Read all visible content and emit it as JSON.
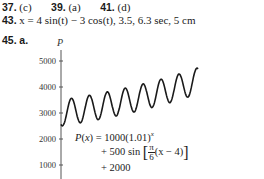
{
  "answers": {
    "line1": [
      {
        "num": "37.",
        "text": "(c)"
      },
      {
        "num": "39.",
        "text": "(a)"
      },
      {
        "num": "41.",
        "text": "(d)"
      }
    ],
    "line2": {
      "num": "43.",
      "text": "x = 4 sin(t) − 3 cos(t), 3.5, 6.3 sec, 5 cm"
    },
    "line3": {
      "num": "45.",
      "part": "a."
    }
  },
  "formula": {
    "line1": "P(x) = 1000(1.01)",
    "exp": "x",
    "line2_prefix": "+ 500 sin",
    "frac_num": "π",
    "frac_den": "6",
    "line2_suffix": "(x − 4)",
    "line3": "+ 2000"
  },
  "chart_data": {
    "type": "line",
    "title": "",
    "xlabel": "",
    "ylabel": "P",
    "yticks": [
      1000,
      2000,
      3000,
      4000,
      5000
    ],
    "ylim": [
      0,
      5500
    ],
    "xlim": [
      0,
      55
    ],
    "grid": false,
    "legend": null,
    "annotation": "P(x) = 1000(1.01)^x + 500 sin[π/6 (x − 4)] + 2000",
    "series": [
      {
        "name": "P(x)",
        "x": [
          0,
          3,
          6,
          9,
          12,
          15,
          18,
          21,
          24,
          27,
          30,
          33,
          36,
          39,
          42,
          45,
          48,
          51,
          54
        ],
        "values": [
          2567,
          3530,
          2561,
          3600,
          2630,
          3660,
          2710,
          3730,
          2780,
          3810,
          2860,
          3890,
          2940,
          3970,
          3020,
          4060,
          3110,
          4150,
          4320
        ]
      }
    ]
  }
}
